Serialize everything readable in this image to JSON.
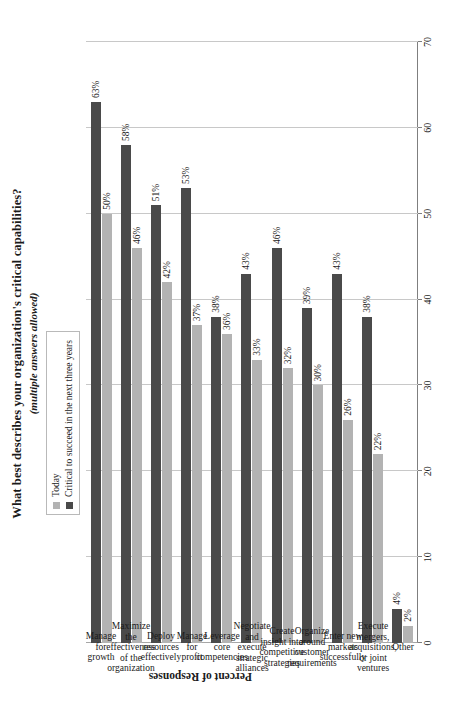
{
  "chart_data": {
    "type": "bar",
    "orientation": "horizontal",
    "title": "What best describes your organization's critical capabilities?",
    "subtitle": "(multiple answers allowed)",
    "xlabel": "",
    "ylabel": "Percent of Responses",
    "axis_title": "Percent of Responses",
    "ylim": [
      0,
      70
    ],
    "ticks": [
      "0",
      "10",
      "20",
      "30",
      "40",
      "50",
      "60",
      "70"
    ],
    "tick_values": [
      0,
      10,
      20,
      30,
      40,
      50,
      60,
      70
    ],
    "grid": true,
    "legend_position": "top",
    "legend": [
      "Today",
      "Critical to succeed in the next three years"
    ],
    "colors": {
      "today": "#b3b3b3",
      "critical": "#4a4a4a",
      "gridline": "#c8c8c8",
      "axis": "#7f7f7f"
    },
    "categories": [
      "Manage for growth",
      "Maximize the effectiveness of the organization",
      "Deploy resources effectively",
      "Manage for profit",
      "Leverage core competencies",
      "Negotiate and execute strategic alliances",
      "Create insight into competitive strategies",
      "Organize around customer requirements",
      "Enter new markets successfully",
      "Execute mergers, acquisitions, or joint ventures",
      "Other"
    ],
    "category_lines": [
      [
        "Manage",
        "for",
        "growth"
      ],
      [
        "Maximize",
        "the",
        "effectiveness",
        "of the",
        "organization"
      ],
      [
        "Deploy",
        "resources",
        "effectively"
      ],
      [
        "Manage",
        "for",
        "profit"
      ],
      [
        "Leverage",
        "core",
        "competencies"
      ],
      [
        "Negotiate",
        "and",
        "execute",
        "strategic",
        "alliances"
      ],
      [
        "Create",
        "insight into",
        "competitive",
        "strategies"
      ],
      [
        "Organize",
        "around",
        "customer",
        "requirements"
      ],
      [
        "Enter new",
        "markets",
        "successfully"
      ],
      [
        "Execute",
        "mergers,",
        "acquisitions,",
        "or joint",
        "ventures"
      ],
      [
        "Other"
      ]
    ],
    "series": [
      {
        "name": "Today",
        "values": [
          50,
          46,
          42,
          37,
          36,
          33,
          32,
          30,
          26,
          22,
          2
        ],
        "labels": [
          "50%",
          "46%",
          "42%",
          "37%",
          "36%",
          "33%",
          "32%",
          "30%",
          "26%",
          "22%",
          "2%"
        ]
      },
      {
        "name": "Critical to succeed in the next three years",
        "values": [
          63,
          58,
          51,
          53,
          38,
          43,
          46,
          39,
          43,
          38,
          4
        ],
        "labels": [
          "63%",
          "58%",
          "51%",
          "53%",
          "38%",
          "43%",
          "46%",
          "39%",
          "43%",
          "38%",
          "4%"
        ]
      }
    ]
  }
}
